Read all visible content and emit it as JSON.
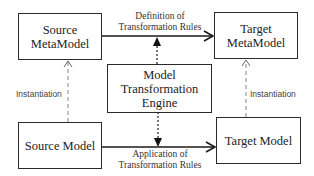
{
  "diagram": {
    "nodes": {
      "source_metamodel": {
        "line1": "Source",
        "line2": "MetaModel"
      },
      "target_metamodel": {
        "line1": "Target",
        "line2": "MetaModel"
      },
      "engine": {
        "line1": "Model",
        "line2": "Transformation",
        "line3": "Engine"
      },
      "source_model": {
        "label": "Source Model"
      },
      "target_model": {
        "label": "Target Model"
      }
    },
    "edges": {
      "definition": {
        "line1": "Definition of",
        "line2": "Transformation Rules"
      },
      "application": {
        "line1": "Application of",
        "line2": "Transformation Rules"
      },
      "instantiation_left": {
        "label": "Instantiation"
      },
      "instantiation_right": {
        "label": "Instantiation"
      }
    },
    "colors": {
      "stroke": "#2a2a2a",
      "dashed": "#888888",
      "text": "#222222"
    }
  }
}
